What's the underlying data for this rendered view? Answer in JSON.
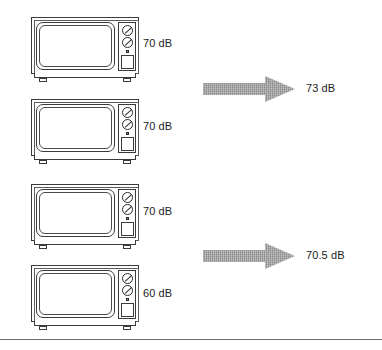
{
  "figure": {
    "unit": "dB",
    "bottom_rule": true,
    "arrow_color": "#8c8c8c",
    "line_color": "#3a3a3a",
    "text_color": "#1b1b1b"
  },
  "sources": [
    {
      "id": "tv-1",
      "label": "70 dB",
      "value": 70,
      "icon": "television-icon"
    },
    {
      "id": "tv-2",
      "label": "70 dB",
      "value": 70,
      "icon": "television-icon"
    },
    {
      "id": "tv-3",
      "label": "70 dB",
      "value": 70,
      "icon": "television-icon"
    },
    {
      "id": "tv-4",
      "label": "60 dB",
      "value": 60,
      "icon": "television-icon"
    }
  ],
  "results": [
    {
      "id": "result-1",
      "label": "73 dB",
      "value": 73,
      "arrow": "right-arrow-icon",
      "combines": [
        "tv-1",
        "tv-2"
      ]
    },
    {
      "id": "result-2",
      "label": "70.5 dB",
      "value": 70.5,
      "arrow": "right-arrow-icon",
      "combines": [
        "tv-3",
        "tv-4"
      ]
    }
  ]
}
